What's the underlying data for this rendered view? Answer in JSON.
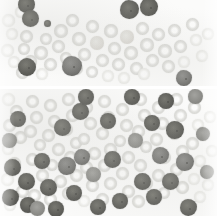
{
  "figure": {
    "width_px": 217,
    "height_px": 216,
    "stain": "grayscale",
    "panel_count": 2,
    "caption_top": "",
    "caption_bottom": "",
    "background_color": "#ffffff",
    "erythrocyte_color": "#e2e2df",
    "leukocyte_color": "#6a6a66",
    "divider_color": "#ffffff"
  },
  "panels": [
    {
      "id": "panel-top",
      "label": "",
      "x": 0,
      "y": 0,
      "width": 217,
      "height": 86,
      "description": "Sparse field: pale ring-form red cells with scattered dark nucleated cells clustered at the left and upper-right",
      "dark_cell_count": 7,
      "pale_cell_count": 46
    },
    {
      "id": "panel-bottom",
      "label": "",
      "x": 0,
      "y": 89,
      "width": 217,
      "height": 127,
      "description": "Dense field: numerous dark nucleated cells intermixed with pale red cells across the whole frame",
      "dark_cell_count": 34,
      "pale_cell_count": 62
    }
  ],
  "cells_top": {
    "pale": [
      {
        "x": 2,
        "y": 14,
        "d": 13,
        "v": "faint"
      },
      {
        "x": 6,
        "y": 28,
        "d": 12,
        "v": "faint"
      },
      {
        "x": 1,
        "y": 44,
        "d": 13,
        "v": "faint"
      },
      {
        "x": 8,
        "y": 56,
        "d": 12,
        "v": "faint"
      },
      {
        "x": 15,
        "y": 6,
        "d": 12,
        "v": "faint"
      },
      {
        "x": 20,
        "y": 30,
        "d": 13,
        "v": "ring"
      },
      {
        "x": 18,
        "y": 43,
        "d": 12,
        "v": "ring"
      },
      {
        "x": 24,
        "y": 55,
        "d": 13,
        "v": "ring"
      },
      {
        "x": 16,
        "y": 66,
        "d": 13,
        "v": "ring"
      },
      {
        "x": 34,
        "y": 46,
        "d": 14,
        "v": "ring"
      },
      {
        "x": 40,
        "y": 33,
        "d": 12,
        "v": "ring"
      },
      {
        "x": 44,
        "y": 58,
        "d": 13,
        "v": "ring"
      },
      {
        "x": 36,
        "y": 68,
        "d": 12,
        "v": "faint"
      },
      {
        "x": 54,
        "y": 24,
        "d": 14,
        "v": "ring"
      },
      {
        "x": 52,
        "y": 40,
        "d": 13,
        "v": "ring"
      },
      {
        "x": 60,
        "y": 52,
        "d": 12,
        "v": "ring"
      },
      {
        "x": 66,
        "y": 14,
        "d": 13,
        "v": "ring"
      },
      {
        "x": 72,
        "y": 32,
        "d": 14,
        "v": "ring"
      },
      {
        "x": 78,
        "y": 48,
        "d": 13,
        "v": "ring"
      },
      {
        "x": 70,
        "y": 62,
        "d": 13,
        "v": "ring"
      },
      {
        "x": 86,
        "y": 20,
        "d": 13,
        "v": "ring"
      },
      {
        "x": 90,
        "y": 36,
        "d": 14,
        "v": "solid"
      },
      {
        "x": 96,
        "y": 54,
        "d": 13,
        "v": "ring"
      },
      {
        "x": 86,
        "y": 66,
        "d": 12,
        "v": "ring"
      },
      {
        "x": 104,
        "y": 24,
        "d": 14,
        "v": "ring"
      },
      {
        "x": 108,
        "y": 42,
        "d": 13,
        "v": "ring"
      },
      {
        "x": 112,
        "y": 58,
        "d": 13,
        "v": "ring"
      },
      {
        "x": 102,
        "y": 70,
        "d": 12,
        "v": "faint"
      },
      {
        "x": 120,
        "y": 30,
        "d": 14,
        "v": "solid"
      },
      {
        "x": 124,
        "y": 46,
        "d": 14,
        "v": "ring"
      },
      {
        "x": 130,
        "y": 62,
        "d": 13,
        "v": "ring"
      },
      {
        "x": 118,
        "y": 72,
        "d": 12,
        "v": "faint"
      },
      {
        "x": 136,
        "y": 22,
        "d": 13,
        "v": "ring"
      },
      {
        "x": 140,
        "y": 38,
        "d": 14,
        "v": "ring"
      },
      {
        "x": 146,
        "y": 54,
        "d": 13,
        "v": "ring"
      },
      {
        "x": 138,
        "y": 68,
        "d": 12,
        "v": "faint"
      },
      {
        "x": 152,
        "y": 28,
        "d": 13,
        "v": "ring"
      },
      {
        "x": 158,
        "y": 44,
        "d": 14,
        "v": "ring"
      },
      {
        "x": 162,
        "y": 60,
        "d": 13,
        "v": "ring"
      },
      {
        "x": 168,
        "y": 24,
        "d": 13,
        "v": "ring"
      },
      {
        "x": 174,
        "y": 40,
        "d": 13,
        "v": "ring"
      },
      {
        "x": 178,
        "y": 56,
        "d": 12,
        "v": "faint"
      },
      {
        "x": 186,
        "y": 18,
        "d": 13,
        "v": "ring"
      },
      {
        "x": 190,
        "y": 34,
        "d": 12,
        "v": "faint"
      },
      {
        "x": 196,
        "y": 50,
        "d": 12,
        "v": "faint"
      },
      {
        "x": 202,
        "y": 28,
        "d": 12,
        "v": "faint"
      }
    ],
    "dark": [
      {
        "x": 18,
        "y": -4,
        "d": 17,
        "v": "dark",
        "clump": false
      },
      {
        "x": 22,
        "y": 10,
        "d": 17,
        "v": "dark",
        "clump": false
      },
      {
        "x": 44,
        "y": 20,
        "d": 7,
        "v": "dark",
        "clump": false
      },
      {
        "x": 18,
        "y": 58,
        "d": 18,
        "v": "dark",
        "clump": false
      },
      {
        "x": 62,
        "y": 56,
        "d": 20,
        "v": "blast",
        "clump": true
      },
      {
        "x": 120,
        "y": 0,
        "d": 19,
        "v": "dark",
        "clump": true
      },
      {
        "x": 140,
        "y": -2,
        "d": 18,
        "v": "dark",
        "clump": true
      },
      {
        "x": 176,
        "y": 70,
        "d": 16,
        "v": "blast",
        "clump": true
      }
    ]
  },
  "cells_bottom": {
    "pale": [
      {
        "x": 2,
        "y": 4,
        "d": 13,
        "v": "faint"
      },
      {
        "x": 10,
        "y": 16,
        "d": 13,
        "v": "ring"
      },
      {
        "x": 3,
        "y": 30,
        "d": 13,
        "v": "ring"
      },
      {
        "x": 14,
        "y": 42,
        "d": 13,
        "v": "ring"
      },
      {
        "x": 2,
        "y": 54,
        "d": 12,
        "v": "faint"
      },
      {
        "x": 8,
        "y": 68,
        "d": 13,
        "v": "ring"
      },
      {
        "x": 1,
        "y": 84,
        "d": 13,
        "v": "faint"
      },
      {
        "x": 16,
        "y": 96,
        "d": 13,
        "v": "ring"
      },
      {
        "x": 4,
        "y": 110,
        "d": 12,
        "v": "faint"
      },
      {
        "x": 26,
        "y": 6,
        "d": 13,
        "v": "ring"
      },
      {
        "x": 30,
        "y": 22,
        "d": 13,
        "v": "ring"
      },
      {
        "x": 24,
        "y": 36,
        "d": 13,
        "v": "ring"
      },
      {
        "x": 34,
        "y": 50,
        "d": 12,
        "v": "ring"
      },
      {
        "x": 26,
        "y": 64,
        "d": 13,
        "v": "ring"
      },
      {
        "x": 36,
        "y": 80,
        "d": 13,
        "v": "ring"
      },
      {
        "x": 28,
        "y": 100,
        "d": 13,
        "v": "ring"
      },
      {
        "x": 44,
        "y": 10,
        "d": 13,
        "v": "ring"
      },
      {
        "x": 48,
        "y": 26,
        "d": 13,
        "v": "ring"
      },
      {
        "x": 42,
        "y": 40,
        "d": 13,
        "v": "ring"
      },
      {
        "x": 52,
        "y": 54,
        "d": 13,
        "v": "ring"
      },
      {
        "x": 46,
        "y": 70,
        "d": 12,
        "v": "ring"
      },
      {
        "x": 54,
        "y": 86,
        "d": 13,
        "v": "ring"
      },
      {
        "x": 44,
        "y": 104,
        "d": 13,
        "v": "ring"
      },
      {
        "x": 62,
        "y": 4,
        "d": 13,
        "v": "ring"
      },
      {
        "x": 66,
        "y": 20,
        "d": 13,
        "v": "ring"
      },
      {
        "x": 60,
        "y": 34,
        "d": 13,
        "v": "ring"
      },
      {
        "x": 70,
        "y": 48,
        "d": 12,
        "v": "ring"
      },
      {
        "x": 64,
        "y": 62,
        "d": 13,
        "v": "ring"
      },
      {
        "x": 70,
        "y": 80,
        "d": 13,
        "v": "ring"
      },
      {
        "x": 62,
        "y": 98,
        "d": 13,
        "v": "ring"
      },
      {
        "x": 80,
        "y": 12,
        "d": 13,
        "v": "ring"
      },
      {
        "x": 84,
        "y": 28,
        "d": 13,
        "v": "ring"
      },
      {
        "x": 78,
        "y": 44,
        "d": 12,
        "v": "ring"
      },
      {
        "x": 88,
        "y": 58,
        "d": 13,
        "v": "ring"
      },
      {
        "x": 80,
        "y": 72,
        "d": 13,
        "v": "ring"
      },
      {
        "x": 86,
        "y": 90,
        "d": 13,
        "v": "ring"
      },
      {
        "x": 78,
        "y": 106,
        "d": 12,
        "v": "faint"
      },
      {
        "x": 98,
        "y": 6,
        "d": 13,
        "v": "ring"
      },
      {
        "x": 102,
        "y": 22,
        "d": 13,
        "v": "ring"
      },
      {
        "x": 96,
        "y": 38,
        "d": 13,
        "v": "ring"
      },
      {
        "x": 104,
        "y": 54,
        "d": 13,
        "v": "ring"
      },
      {
        "x": 98,
        "y": 70,
        "d": 13,
        "v": "ring"
      },
      {
        "x": 104,
        "y": 88,
        "d": 13,
        "v": "ring"
      },
      {
        "x": 96,
        "y": 104,
        "d": 13,
        "v": "ring"
      },
      {
        "x": 116,
        "y": 14,
        "d": 13,
        "v": "ring"
      },
      {
        "x": 120,
        "y": 30,
        "d": 13,
        "v": "ring"
      },
      {
        "x": 114,
        "y": 46,
        "d": 12,
        "v": "ring"
      },
      {
        "x": 122,
        "y": 62,
        "d": 13,
        "v": "ring"
      },
      {
        "x": 116,
        "y": 78,
        "d": 13,
        "v": "ring"
      },
      {
        "x": 122,
        "y": 96,
        "d": 13,
        "v": "ring"
      },
      {
        "x": 134,
        "y": 4,
        "d": 13,
        "v": "ring"
      },
      {
        "x": 138,
        "y": 20,
        "d": 13,
        "v": "ring"
      },
      {
        "x": 132,
        "y": 36,
        "d": 13,
        "v": "ring"
      },
      {
        "x": 140,
        "y": 52,
        "d": 12,
        "v": "ring"
      },
      {
        "x": 134,
        "y": 70,
        "d": 13,
        "v": "ring"
      },
      {
        "x": 140,
        "y": 88,
        "d": 13,
        "v": "ring"
      },
      {
        "x": 132,
        "y": 106,
        "d": 13,
        "v": "ring"
      },
      {
        "x": 152,
        "y": 12,
        "d": 13,
        "v": "ring"
      },
      {
        "x": 156,
        "y": 28,
        "d": 13,
        "v": "ring"
      },
      {
        "x": 150,
        "y": 44,
        "d": 13,
        "v": "ring"
      },
      {
        "x": 158,
        "y": 62,
        "d": 13,
        "v": "ring"
      },
      {
        "x": 152,
        "y": 80,
        "d": 13,
        "v": "ring"
      },
      {
        "x": 158,
        "y": 98,
        "d": 12,
        "v": "ring"
      },
      {
        "x": 170,
        "y": 4,
        "d": 13,
        "v": "ring"
      },
      {
        "x": 174,
        "y": 20,
        "d": 13,
        "v": "ring"
      },
      {
        "x": 168,
        "y": 38,
        "d": 13,
        "v": "ring"
      },
      {
        "x": 176,
        "y": 56,
        "d": 13,
        "v": "ring"
      },
      {
        "x": 170,
        "y": 74,
        "d": 13,
        "v": "ring"
      },
      {
        "x": 176,
        "y": 92,
        "d": 13,
        "v": "ring"
      },
      {
        "x": 188,
        "y": 12,
        "d": 13,
        "v": "ring"
      },
      {
        "x": 192,
        "y": 30,
        "d": 12,
        "v": "faint"
      },
      {
        "x": 186,
        "y": 48,
        "d": 13,
        "v": "ring"
      },
      {
        "x": 194,
        "y": 66,
        "d": 12,
        "v": "faint"
      },
      {
        "x": 188,
        "y": 84,
        "d": 12,
        "v": "faint"
      },
      {
        "x": 194,
        "y": 102,
        "d": 12,
        "v": "faint"
      },
      {
        "x": 204,
        "y": 22,
        "d": 12,
        "v": "faint"
      },
      {
        "x": 206,
        "y": 56,
        "d": 12,
        "v": "faint"
      },
      {
        "x": 202,
        "y": 90,
        "d": 12,
        "v": "faint"
      }
    ],
    "dark": [
      {
        "x": 10,
        "y": 22,
        "d": 16,
        "v": "dark",
        "clump": false
      },
      {
        "x": 2,
        "y": 44,
        "d": 15,
        "v": "mid",
        "clump": true
      },
      {
        "x": 4,
        "y": 70,
        "d": 17,
        "v": "dark",
        "clump": false
      },
      {
        "x": 18,
        "y": 84,
        "d": 17,
        "v": "dark",
        "clump": false
      },
      {
        "x": 2,
        "y": 100,
        "d": 17,
        "v": "dark",
        "clump": true
      },
      {
        "x": 20,
        "y": 108,
        "d": 16,
        "v": "dark",
        "clump": false
      },
      {
        "x": 34,
        "y": 64,
        "d": 16,
        "v": "dark",
        "clump": false
      },
      {
        "x": 40,
        "y": 90,
        "d": 17,
        "v": "dark",
        "clump": false
      },
      {
        "x": 30,
        "y": 112,
        "d": 15,
        "v": "mid",
        "clump": true
      },
      {
        "x": 48,
        "y": 112,
        "d": 16,
        "v": "dark",
        "clump": false
      },
      {
        "x": 54,
        "y": 30,
        "d": 17,
        "v": "dark",
        "clump": false
      },
      {
        "x": 58,
        "y": 68,
        "d": 18,
        "v": "blast",
        "clump": true
      },
      {
        "x": 66,
        "y": 96,
        "d": 16,
        "v": "dark",
        "clump": false
      },
      {
        "x": 72,
        "y": 14,
        "d": 17,
        "v": "dark",
        "clump": false
      },
      {
        "x": 78,
        "y": 0,
        "d": 16,
        "v": "dark",
        "clump": false
      },
      {
        "x": 74,
        "y": 60,
        "d": 16,
        "v": "blast",
        "clump": true
      },
      {
        "x": 86,
        "y": 78,
        "d": 15,
        "v": "mid",
        "clump": true
      },
      {
        "x": 90,
        "y": 110,
        "d": 16,
        "v": "dark",
        "clump": false
      },
      {
        "x": 100,
        "y": 24,
        "d": 16,
        "v": "dark",
        "clump": false
      },
      {
        "x": 104,
        "y": 62,
        "d": 17,
        "v": "dark",
        "clump": false
      },
      {
        "x": 112,
        "y": 104,
        "d": 16,
        "v": "dark",
        "clump": false
      },
      {
        "x": 124,
        "y": 0,
        "d": 16,
        "v": "dark",
        "clump": false
      },
      {
        "x": 128,
        "y": 44,
        "d": 15,
        "v": "mid",
        "clump": true
      },
      {
        "x": 134,
        "y": 84,
        "d": 17,
        "v": "dark",
        "clump": false
      },
      {
        "x": 144,
        "y": 26,
        "d": 16,
        "v": "dark",
        "clump": false
      },
      {
        "x": 152,
        "y": 58,
        "d": 17,
        "v": "blast",
        "clump": true
      },
      {
        "x": 146,
        "y": 100,
        "d": 16,
        "v": "dark",
        "clump": false
      },
      {
        "x": 158,
        "y": 4,
        "d": 16,
        "v": "dark",
        "clump": false
      },
      {
        "x": 166,
        "y": 32,
        "d": 18,
        "v": "dark",
        "clump": true
      },
      {
        "x": 162,
        "y": 84,
        "d": 17,
        "v": "dark",
        "clump": false
      },
      {
        "x": 176,
        "y": 64,
        "d": 18,
        "v": "blast",
        "clump": true
      },
      {
        "x": 180,
        "y": 110,
        "d": 17,
        "v": "dark",
        "clump": true
      },
      {
        "x": 188,
        "y": 0,
        "d": 15,
        "v": "mid",
        "clump": true
      },
      {
        "x": 196,
        "y": 38,
        "d": 14,
        "v": "mid",
        "clump": true
      },
      {
        "x": 200,
        "y": 76,
        "d": 14,
        "v": "mid",
        "clump": true
      }
    ]
  }
}
